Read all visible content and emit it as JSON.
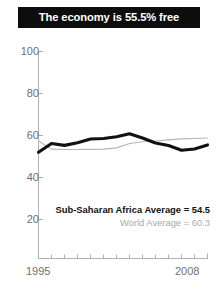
{
  "title": {
    "text": "The economy is 55.5% free"
  },
  "legend": {
    "primary": "Sub-Saharan Africa Average = 54.5",
    "secondary": "World Average = 60.3"
  },
  "axis": {
    "y_ticks": [
      "100",
      "80",
      "60",
      "40",
      "20"
    ],
    "x_start": "1995",
    "x_end": "2008"
  },
  "colors": {
    "title_bar": "#0d0d0d",
    "title_text": "#ffffff",
    "primary_series": "#111111",
    "secondary_series": "#b4b4b4",
    "axis": "#b0b0b0",
    "tick_label": "#6f6f6f"
  },
  "chart_data": {
    "type": "line",
    "title": "The economy is 55.5% free",
    "xlabel": "",
    "ylabel": "",
    "xlim": [
      1995,
      2008
    ],
    "ylim": [
      0,
      100
    ],
    "yticks": [
      20,
      40,
      60,
      80,
      100
    ],
    "grid": false,
    "legend_position": "bottom-right",
    "x": [
      1995,
      1996,
      1997,
      1998,
      1999,
      2000,
      2001,
      2002,
      2003,
      2004,
      2005,
      2006,
      2007,
      2008
    ],
    "series": [
      {
        "name": "Sub-Saharan Africa Average",
        "label": "Sub-Saharan Africa Average = 54.5",
        "color": "#111111",
        "width": "thick",
        "values": [
          52.0,
          56.2,
          55.3,
          56.5,
          58.3,
          58.6,
          59.4,
          60.8,
          58.8,
          56.4,
          55.2,
          53.0,
          53.6,
          55.5
        ]
      },
      {
        "name": "World Average",
        "label": "World Average = 60.3",
        "color": "#b4b4b4",
        "width": "thin",
        "values": [
          57.4,
          53.5,
          53.3,
          53.3,
          53.4,
          53.5,
          54.1,
          56.2,
          57.0,
          57.4,
          57.9,
          58.4,
          58.6,
          58.8
        ]
      }
    ],
    "annotations": [
      {
        "text": "Sub-Saharan Africa Average = 54.5",
        "value": 54.5
      },
      {
        "text": "World Average = 60.3",
        "value": 60.3
      }
    ]
  }
}
